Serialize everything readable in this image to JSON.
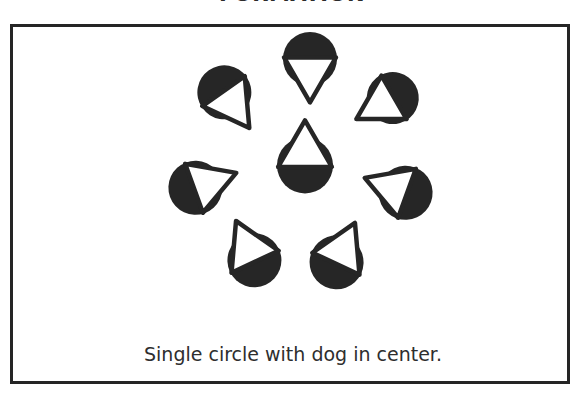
{
  "figure": {
    "title": "FORMATION",
    "caption": "Single circle with dog in center.",
    "frame_color": "#252525",
    "background_color": "#ffffff"
  },
  "stimulus": {
    "glyph_name": "circle-triangle-glyph",
    "disc_color": "#262626",
    "triangle_fill": "#ffffff",
    "triangle_stroke": "#262626",
    "description": "Seven black discs each overlapped by a white outlined triangle; six arranged in a ring, one at the center.",
    "glyphs": [
      {
        "id": "glyph-top",
        "role": "ring",
        "cx": 297,
        "cy": 40,
        "rotation": 180,
        "disc_r": 27,
        "tri_r": 30
      },
      {
        "id": "glyph-upper-right",
        "role": "ring",
        "cx": 373,
        "cy": 75,
        "rotation": 240,
        "disc_r": 26,
        "tri_r": 29
      },
      {
        "id": "glyph-lower-right",
        "role": "ring",
        "cx": 385,
        "cy": 163,
        "rotation": 290,
        "disc_r": 27,
        "tri_r": 30
      },
      {
        "id": "glyph-bottom-right",
        "role": "ring",
        "cx": 327,
        "cy": 228,
        "rotation": 25,
        "disc_r": 27,
        "tri_r": 30
      },
      {
        "id": "glyph-bottom-left",
        "role": "ring",
        "cx": 238,
        "cy": 226,
        "rotation": 335,
        "disc_r": 27,
        "tri_r": 30
      },
      {
        "id": "glyph-lower-left",
        "role": "ring",
        "cx": 190,
        "cy": 158,
        "rotation": 70,
        "disc_r": 27,
        "tri_r": 30
      },
      {
        "id": "glyph-upper-left",
        "role": "ring",
        "cx": 216,
        "cy": 72,
        "rotation": 145,
        "disc_r": 27,
        "tri_r": 30
      },
      {
        "id": "glyph-center",
        "role": "center",
        "cx": 292,
        "cy": 130,
        "rotation": 0,
        "disc_r": 28,
        "tri_r": 31
      }
    ]
  }
}
